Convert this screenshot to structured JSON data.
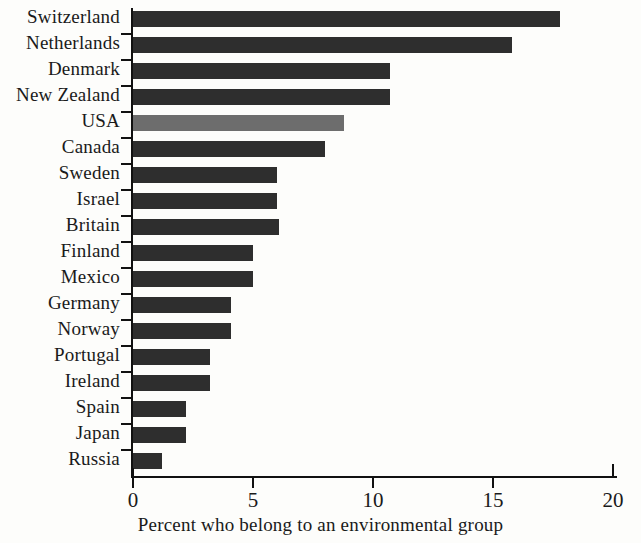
{
  "chart_data": {
    "type": "bar",
    "orientation": "horizontal",
    "title": "",
    "xlabel": "Percent who belong to an environmental group",
    "ylabel": "",
    "xlim": [
      0,
      20
    ],
    "xticks": [
      0,
      5,
      10,
      15,
      20
    ],
    "xtick_labels": [
      "0",
      "5",
      "10",
      "15",
      "20"
    ],
    "grid": false,
    "legend": "none",
    "categories": [
      "Switzerland",
      "Netherlands",
      "Denmark",
      "New Zealand",
      "USA",
      "Canada",
      "Sweden",
      "Israel",
      "Britain",
      "Finland",
      "Mexico",
      "Germany",
      "Norway",
      "Portugal",
      "Ireland",
      "Spain",
      "Japan",
      "Russia"
    ],
    "values": [
      17.8,
      15.8,
      10.7,
      10.7,
      8.8,
      8.0,
      6.0,
      6.0,
      6.1,
      5.0,
      5.0,
      4.1,
      4.1,
      3.2,
      3.2,
      2.2,
      2.2,
      1.2
    ],
    "highlight_category": "USA",
    "colors": {
      "bar": "#2e2e2e",
      "bar_highlight": "#6d6d6d",
      "axis": "#111111",
      "background": "#fdfdfb",
      "text": "#1a1a1a"
    }
  }
}
